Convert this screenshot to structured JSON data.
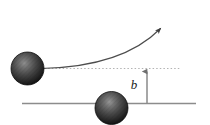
{
  "figure": {
    "name": "impact-parameter-scattering-diagram",
    "background_color": "#ffffff",
    "width": 210,
    "height": 125,
    "labels": {
      "impact_parameter": "b"
    },
    "colors": {
      "sphere_dark": "#1c1c1c",
      "sphere_mid": "#4a4a4a",
      "sphere_highlight": "#9a9a9a",
      "sphere_edge": "#0a0a0a",
      "trajectory_line": "#4d4d4d",
      "asymptote_line": "#b0b0b0",
      "baseline": "#8c8c8c",
      "measure_arrow": "#8a8a8a",
      "label_text": "#1a1a1a"
    },
    "elements": {
      "incoming_particle": {
        "label": "incoming-particle-sphere",
        "cx": 27.5,
        "cy": 68.5,
        "r": 16.5
      },
      "target_particle": {
        "label": "target-particle-sphere",
        "cx": 111.5,
        "cy": 108.0,
        "r": 16.5
      },
      "asymptote": {
        "label": "horizontal-asymptote-dotted",
        "x1": 41,
        "x2": 181,
        "y": 68.5,
        "dash": "1.6 2.2"
      },
      "baseline": {
        "label": "horizontal-baseline",
        "x1": 22,
        "x2": 196,
        "y": 103.5
      },
      "trajectory": {
        "label": "deflected-trajectory-curve",
        "path": "M 41 68.5 C 86 67.5 131 56 158 31",
        "arrow_tip_x": 177,
        "arrow_tip_y": 14.5
      },
      "impact_measure": {
        "label": "impact-parameter-measure",
        "x": 147,
        "y_top": 68.5,
        "y_bottom": 103.5,
        "label_x": 137,
        "label_y": 85
      }
    }
  }
}
